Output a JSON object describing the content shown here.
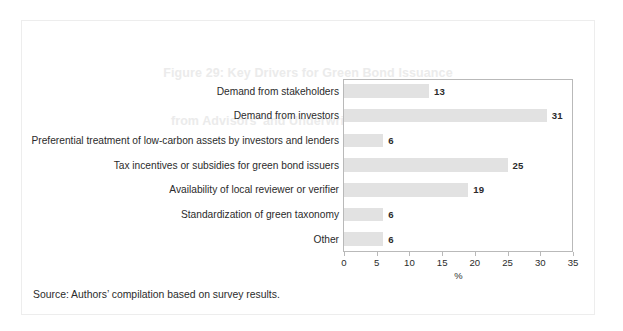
{
  "figure": {
    "title_line1": "Figure 29: Key Drivers for Green Bond Issuance",
    "title_line2": "from Advisors’ and Underwriters’ Perspective",
    "source_note": "Source: Authors’ compilation based on survey results.",
    "title_color": "#ebebeb",
    "bar_color": "#e2e2e2",
    "axis_color": "#b9b9b9",
    "text_color": "#2b2b2b",
    "frame_color": "#ededed"
  },
  "chart_data": {
    "type": "bar",
    "orientation": "horizontal",
    "title": "Figure 29: Key Drivers for Green Bond Issuance from Advisors’ and Underwriters’ Perspective",
    "categories": [
      "Demand from stakeholders",
      "Demand from investors",
      "Preferential treatment of low-carbon assets by investors and lenders",
      "Tax incentives or subsidies for green bond issuers",
      "Availability of local reviewer or verifier",
      "Standardization of green taxonomy",
      "Other"
    ],
    "values": [
      13,
      31,
      6,
      25,
      19,
      6,
      6
    ],
    "value_labels": [
      "13",
      "31",
      "6",
      "25",
      "19",
      "6",
      "6"
    ],
    "xlabel": "%",
    "ylabel": "",
    "xlim": [
      0,
      35
    ],
    "xticks": [
      0,
      5,
      10,
      15,
      20,
      25,
      30,
      35
    ],
    "xtick_labels": [
      "0",
      "5",
      "10",
      "15",
      "20",
      "25",
      "30",
      "35"
    ],
    "grid": false,
    "legend": null
  }
}
